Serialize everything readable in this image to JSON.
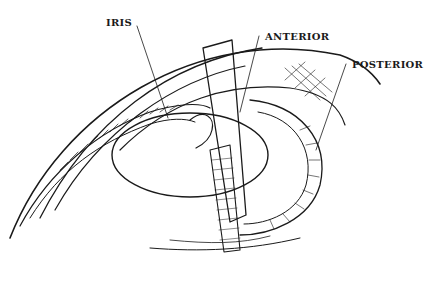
{
  "figure": {
    "labels": [
      {
        "id": "iris",
        "text": "IRIS",
        "x": 106,
        "y": 17
      },
      {
        "id": "anterior",
        "text": "ANTERIOR",
        "x": 265,
        "y": 31
      },
      {
        "id": "posterior",
        "text": "POSTERIOR",
        "x": 352,
        "y": 59
      }
    ],
    "colors": {
      "ink": "#1a1a1a",
      "background": "#ffffff"
    }
  }
}
